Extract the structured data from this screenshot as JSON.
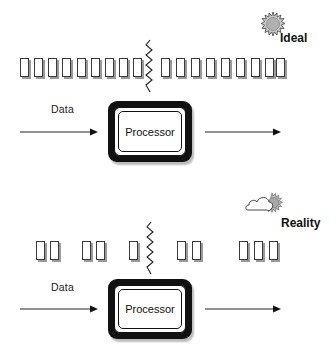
{
  "diagram": {
    "panels": [
      {
        "id": "ideal",
        "title": "Ideal",
        "icon": "sun-icon",
        "input_label": "Data",
        "processor_label": "Processor",
        "packets_before_break": 9,
        "packets_after_break": 9,
        "packet_groups": [
          9,
          9
        ]
      },
      {
        "id": "reality",
        "title": "Reality",
        "icon": "cloud-sun-icon",
        "input_label": "Data",
        "processor_label": "Processor",
        "packet_groups": [
          2,
          2,
          1,
          2,
          3
        ]
      }
    ],
    "colors": {
      "stroke": "#111111",
      "packet_shadow": "#9a9a9a",
      "sun_fill": "#b5b5b5",
      "background": "#ffffff"
    }
  }
}
